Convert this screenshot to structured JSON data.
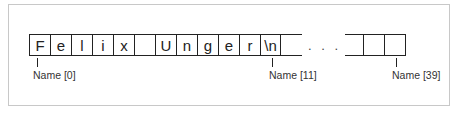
{
  "diagram": {
    "cells": [
      "F",
      "e",
      "l",
      "i",
      "x",
      " ",
      "U",
      "n",
      "g",
      "e",
      "r",
      "\\n"
    ],
    "ellipsis": ". . .",
    "labels": {
      "first": "Name [0]",
      "newline": "Name [11]",
      "last": "Name [39]"
    }
  }
}
